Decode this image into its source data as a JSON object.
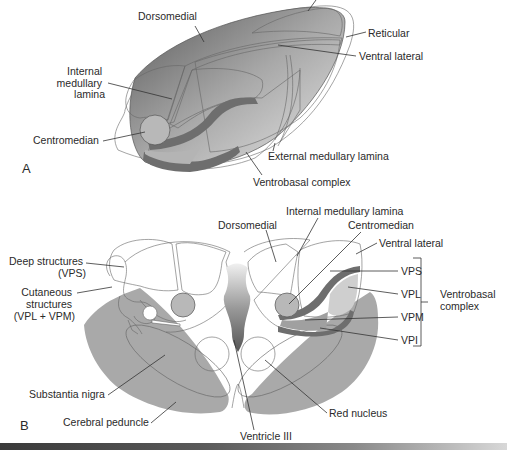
{
  "figure": {
    "panel_a": {
      "letter": "A",
      "labels": {
        "dorsomedial": "Dorsomedial",
        "reticular": "Reticular",
        "ventral_lateral": "Ventral lateral",
        "internal_medullary_lamina": [
          "Internal",
          "medullary",
          "lamina"
        ],
        "centromedian": "Centromedian",
        "external_medullary_lamina": "External medullary lamina",
        "ventrobasal_complex": "Ventrobasal complex"
      }
    },
    "panel_b": {
      "letter": "B",
      "labels": {
        "dorsomedial": "Dorsomedial",
        "internal_medullary_lamina": "Internal medullary lamina",
        "centromedian": "Centromedian",
        "ventral_lateral": "Ventral lateral",
        "deep_structures": [
          "Deep structures",
          "(VPS)"
        ],
        "cutaneous_structures": [
          "Cutaneous",
          "structures",
          "(VPL + VPM)"
        ],
        "vps": "VPS",
        "vpl": "VPL",
        "vpm": "VPM",
        "vpi": "VPI",
        "ventrobasal_complex": [
          "Ventrobasal",
          "complex"
        ],
        "substantia_nigra": "Substantia nigra",
        "cerebral_peduncle": "Cerebral peduncle",
        "red_nucleus": "Red nucleus",
        "ventricle_iii": "Ventricle III"
      }
    },
    "colors": {
      "light_fill": "#d9d9d9",
      "mid_fill": "#b8b8b8",
      "dark_band": "#6e6e6e",
      "peduncle": "#a9a9a9",
      "nucleus": "#bdbdbd"
    }
  }
}
